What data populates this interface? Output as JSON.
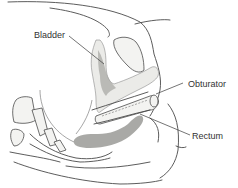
{
  "figure": {
    "type": "anatomical-illustration"
  },
  "labels": {
    "bladder": "Bladder",
    "obturator": "Obturator",
    "rectum": "Rectum"
  },
  "colors": {
    "line": "#4a4a4a",
    "organ_fill": "#ebebe8",
    "dark_tissue": "#a9a9a6",
    "label_text": "#333333"
  }
}
